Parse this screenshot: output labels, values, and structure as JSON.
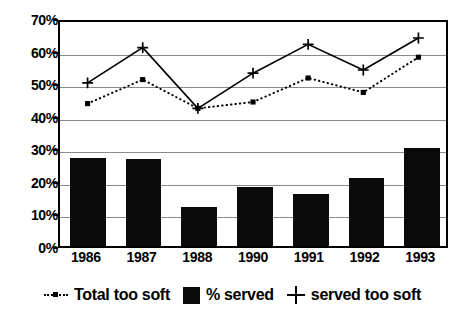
{
  "chart_data": {
    "type": "bar",
    "title": "",
    "subtitle": "",
    "xlabel": "",
    "ylabel": "",
    "categories": [
      "1986",
      "1987",
      "1988",
      "1990",
      "1991",
      "1992",
      "1993"
    ],
    "ylim": [
      0,
      70
    ],
    "y_ticks": [
      "0%",
      "10%",
      "20%",
      "30%",
      "40%",
      "50%",
      "60%",
      "70%"
    ],
    "y_tick_values": [
      0,
      10,
      20,
      30,
      40,
      50,
      60,
      70
    ],
    "grid": true,
    "legend_position": "bottom",
    "series": [
      {
        "name": "Total too soft",
        "type": "line",
        "style": "dotted",
        "marker": "square",
        "values": [
          44.5,
          52,
          43,
          45,
          52.5,
          48,
          59
        ]
      },
      {
        "name": "% served",
        "type": "bar",
        "style": "solid-fill",
        "marker": "none",
        "values": [
          27,
          26.8,
          12,
          18,
          16,
          21,
          30
        ]
      },
      {
        "name": "served too soft",
        "type": "line",
        "style": "solid",
        "marker": "plus",
        "values": [
          51,
          62,
          43,
          54,
          63,
          55,
          65
        ]
      }
    ]
  },
  "legend": {
    "items": [
      {
        "label": "Total too soft",
        "swatch": "dotted-line-square-marker-icon"
      },
      {
        "label": "% served",
        "swatch": "filled-square-icon"
      },
      {
        "label": "served too soft",
        "swatch": "plus-marker-icon"
      }
    ]
  },
  "colors": {
    "series_line": "#000000",
    "bar_fill": "#0a0a0a",
    "gridline": "#8a8a8a",
    "axis": "#000000",
    "background": "#ffffff"
  }
}
